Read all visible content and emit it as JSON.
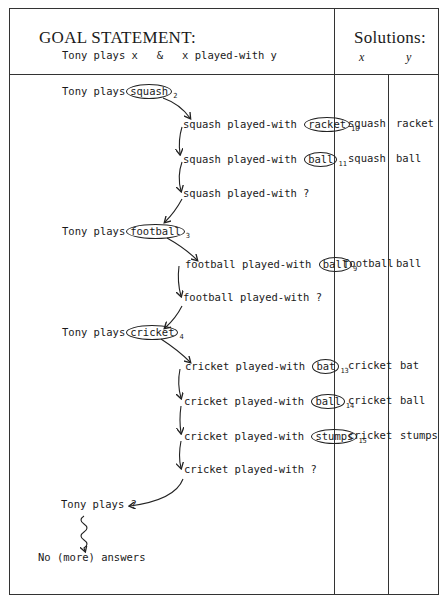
{
  "header": {
    "title": "GOAL STATEMENT:",
    "goal": "Tony plays x   &   x played-with y",
    "solutions_title": "Solutions:",
    "col_x": "x",
    "col_y": "y"
  },
  "trace": [
    {
      "type": "goal",
      "prefix": "Tony plays",
      "circled": "squash",
      "index": "2"
    },
    {
      "type": "subgoal",
      "prefix": "squash played-with",
      "circled": "racket",
      "index": "10"
    },
    {
      "type": "subgoal",
      "prefix": "squash played-with",
      "circled": "ball",
      "index": "11"
    },
    {
      "type": "fail",
      "text": "squash played-with ?"
    },
    {
      "type": "goal",
      "prefix": "Tony plays",
      "circled": "football",
      "index": "3"
    },
    {
      "type": "subgoal",
      "prefix": "football played-with",
      "circled": "ball",
      "index": "9"
    },
    {
      "type": "fail",
      "text": "football played-with ?"
    },
    {
      "type": "goal",
      "prefix": "Tony plays",
      "circled": "cricket",
      "index": "4"
    },
    {
      "type": "subgoal",
      "prefix": "cricket played-with",
      "circled": "bat",
      "index": "13"
    },
    {
      "type": "subgoal",
      "prefix": "cricket played-with",
      "circled": "ball",
      "index": "14"
    },
    {
      "type": "subgoal",
      "prefix": "cricket played-with",
      "circled": "stumps",
      "index": "15"
    },
    {
      "type": "fail",
      "text": "cricket played-with ?"
    },
    {
      "type": "fail",
      "text": "Tony plays ?"
    },
    {
      "type": "end",
      "text": "No (more) answers"
    }
  ],
  "solutions": [
    {
      "x": "squash",
      "y": "racket"
    },
    {
      "x": "squash",
      "y": "ball"
    },
    {
      "x": "football",
      "y": "ball"
    },
    {
      "x": "cricket",
      "y": "bat"
    },
    {
      "x": "cricket",
      "y": "ball"
    },
    {
      "x": "cricket",
      "y": "stumps"
    }
  ]
}
